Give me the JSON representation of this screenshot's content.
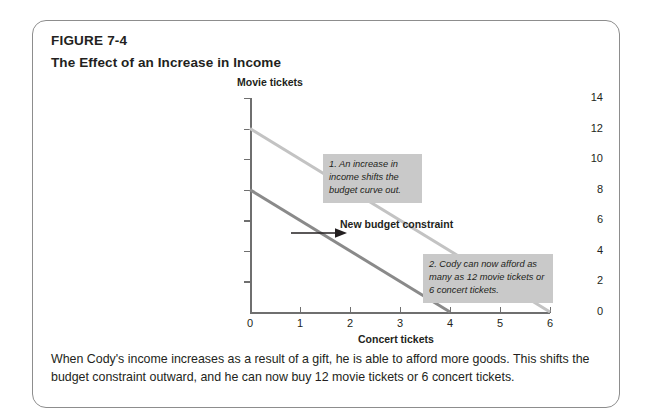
{
  "figure": {
    "number": "FIGURE 7-4",
    "title": "The Effect of an Increase in Income",
    "caption": "When Cody's income increases as a result of a gift, he is able to afford more goods. This shifts the budget constraint outward, and he can now buy 12 movie tickets or 6 concert tickets."
  },
  "annotations": {
    "callout_1": "1. An increase in income shifts the budget curve out.",
    "callout_2": "2. Cody can now afford as many as 12 movie tickets or 6 concert tickets.",
    "new_budget_label": "New budget constraint",
    "shift_arrow": "right-arrow-icon"
  },
  "colors": {
    "original_line": "#8a8a8a",
    "new_line": "#c3c3c3",
    "axis": "#6f6f6f",
    "callout_background": "#c9c9c9",
    "card_border": "#8d8d8d",
    "text": "#231f20"
  },
  "chart_data": {
    "type": "line",
    "title": "The Effect of an Increase in Income",
    "xlabel": "Concert tickets",
    "ylabel": "Movie tickets",
    "xlim": [
      0,
      6
    ],
    "ylim": [
      0,
      14
    ],
    "xticks": [
      0,
      1,
      2,
      3,
      4,
      5,
      6
    ],
    "yticks": [
      0,
      2,
      4,
      6,
      8,
      10,
      12,
      14
    ],
    "grid": false,
    "legend": "none",
    "series": [
      {
        "name": "Original budget constraint",
        "color": "#8a8a8a",
        "points": [
          {
            "x": 0,
            "y": 8
          },
          {
            "x": 4,
            "y": 0
          }
        ]
      },
      {
        "name": "New budget constraint",
        "color": "#c3c3c3",
        "points": [
          {
            "x": 0,
            "y": 12
          },
          {
            "x": 6,
            "y": 0
          }
        ]
      }
    ]
  }
}
